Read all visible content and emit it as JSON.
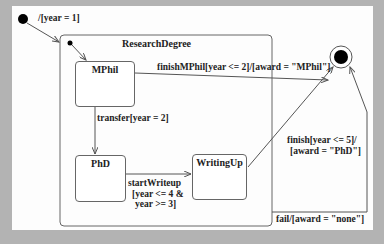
{
  "diagram": {
    "type": "UML state machine",
    "composite_state": {
      "name": "ResearchDegree"
    },
    "states": [
      {
        "id": "mphil",
        "name": "MPhil"
      },
      {
        "id": "phd",
        "name": "PhD"
      },
      {
        "id": "writingup",
        "name": "WritingUp"
      }
    ],
    "transitions": {
      "initial": "/[year = 1]",
      "finish_mphil": "finishMPhil[year <= 2]/[award = \"MPhil\"]",
      "transfer": "transfer[year = 2]",
      "start_writeup_line1": "startWriteup",
      "start_writeup_line2": "[year <= 4 &",
      "start_writeup_line3": "year >= 3]",
      "finish_line1": "finish[year <= 5]/",
      "finish_line2": "[award = \"PhD\"]",
      "fail": "fail/[award = \"none\"]"
    },
    "colors": {
      "background": "#b3b3b3",
      "canvas": "#fdfdfd",
      "line": "#555555",
      "node": "#000000"
    }
  }
}
